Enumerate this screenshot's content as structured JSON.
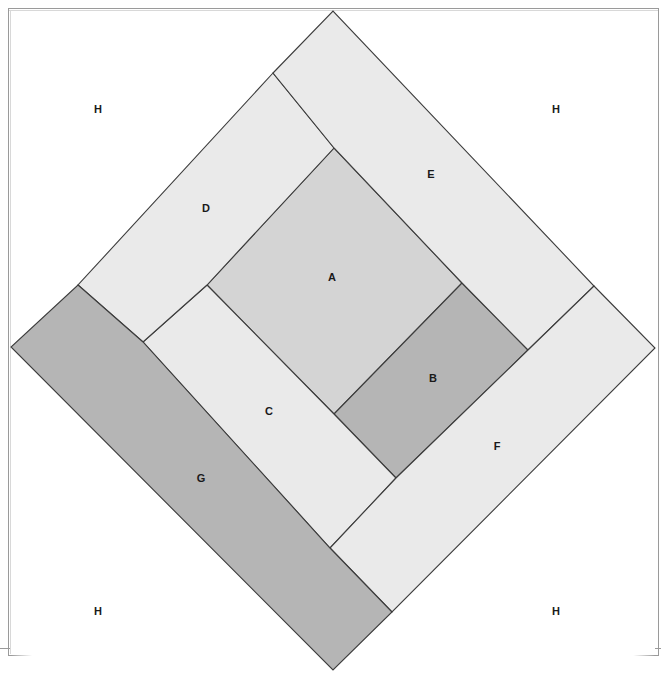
{
  "figure": {
    "canvas": {
      "width": 661,
      "height": 686
    },
    "stroke_color": "#3c3c3c",
    "background_color": "#ffffff",
    "outer_diamond": {
      "top": {
        "x": 333,
        "y": 11
      },
      "right": {
        "x": 655,
        "y": 348
      },
      "bottom": {
        "x": 333,
        "y": 670
      },
      "left": {
        "x": 11,
        "y": 347
      }
    },
    "palette": {
      "corner_white": "#ffffff",
      "band_light": "#eaeaea",
      "square_mid": "#d4d4d4",
      "square_dark": "#b5b5b5"
    },
    "regions": [
      {
        "id": "A",
        "label": "A",
        "role": "central-square",
        "fill": "#d4d4d4",
        "label_x": 332,
        "label_y": 278,
        "points": "334,148 462,283 334,414 207,285"
      },
      {
        "id": "B",
        "label": "B",
        "role": "dark-square-right",
        "fill": "#b5b5b5",
        "label_x": 433,
        "label_y": 379,
        "points": "462,283 528,350 396,478 334,414"
      },
      {
        "id": "C",
        "label": "C",
        "role": "light-band-lower-left",
        "fill": "#eaeaea",
        "label_x": 269,
        "label_y": 412,
        "points": "207,285 334,414 396,478 330,548 143,342"
      },
      {
        "id": "D",
        "label": "D",
        "role": "light-band-upper-left",
        "fill": "#eaeaea",
        "label_x": 206,
        "label_y": 209,
        "points": "273,73 334,148 207,285 143,342 78,285"
      },
      {
        "id": "E",
        "label": "E",
        "role": "light-band-upper-right",
        "fill": "#eaeaea",
        "label_x": 431,
        "label_y": 175,
        "points": "273,73 333,11 594,286 528,350 462,283 334,148"
      },
      {
        "id": "F",
        "label": "F",
        "role": "light-band-lower-right",
        "fill": "#eaeaea",
        "label_x": 497,
        "label_y": 447,
        "points": "594,286 655,348 392,612 330,548 396,478 528,350"
      },
      {
        "id": "G",
        "label": "G",
        "role": "dark-band-lower-left",
        "fill": "#b5b5b5",
        "label_x": 201,
        "label_y": 479,
        "points": "78,285 143,342 330,548 392,612 333,670 11,347"
      }
    ],
    "corner_regions": [
      {
        "id": "H-top-left",
        "label": "H",
        "fill": "#ffffff",
        "label_x": 98,
        "label_y": 110,
        "points": "11,11 333,11 11,347"
      },
      {
        "id": "H-top-right",
        "label": "H",
        "fill": "#ffffff",
        "label_x": 556,
        "label_y": 110,
        "points": "333,11 655,11 655,348"
      },
      {
        "id": "H-bottom-left",
        "label": "H",
        "fill": "#ffffff",
        "label_x": 98,
        "label_y": 612,
        "points": "11,347 333,670 11,655"
      },
      {
        "id": "H-bottom-right",
        "label": "H",
        "fill": "#ffffff",
        "label_x": 556,
        "label_y": 612,
        "points": "655,348 655,655 333,670"
      }
    ]
  }
}
